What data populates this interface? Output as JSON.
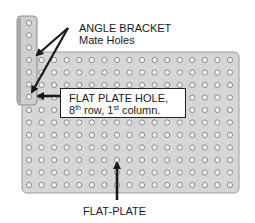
{
  "labels": {
    "angle_bracket_line1": "ANGLE BRACKET",
    "angle_bracket_line2": "Mate Holes",
    "callout_line1": "FLAT PLATE HOLE,",
    "callout_row_num": "8",
    "callout_row_sup": "th",
    "callout_row_text": " row, ",
    "callout_col_num": "1",
    "callout_col_sup": "st",
    "callout_col_text": " column.",
    "flat_plate": "FLAT-PLATE"
  },
  "plate": {
    "columns": 17,
    "rows": 11,
    "x": 22,
    "y": 52,
    "width": 217,
    "height": 141,
    "first_hole_x": 29,
    "first_hole_y": 60,
    "pitch_x": 12.56,
    "pitch_y": 12.5,
    "fill": "#d6d6d6",
    "edge": "#9a9a9a"
  },
  "bracket": {
    "holes": 7,
    "x": 17,
    "y": 16,
    "width": 20,
    "height": 89,
    "hole_x": 29,
    "first_hole_y": 23,
    "pitch_y": 12.3,
    "fill": "#cfcfcf",
    "edge": "#8a8a8a"
  },
  "colors": {
    "hole_fill": "#f4f4f4",
    "hole_edge": "#8c8c8c",
    "arrow": "#1a1a1a"
  }
}
